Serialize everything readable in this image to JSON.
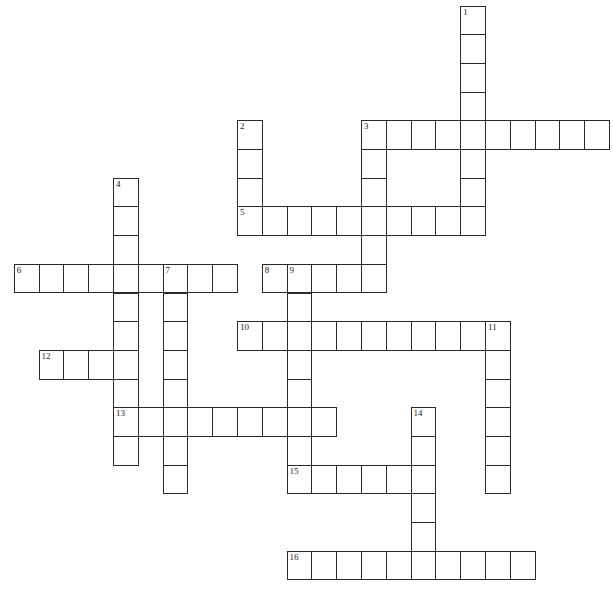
{
  "puzzle": {
    "type": "crossword",
    "layout": {
      "origin_x": 14.3,
      "origin_y": 6,
      "cell_w": 24.8,
      "cell_h": 28.7
    },
    "colors": {
      "border": "#2a2a2a",
      "cell_bg": "#ffffff",
      "number": "#222222"
    },
    "across": [
      {
        "number": "3",
        "row": 4,
        "col": 14,
        "length": 10
      },
      {
        "number": "5",
        "row": 7,
        "col": 9,
        "length": 10
      },
      {
        "number": "6",
        "row": 9,
        "col": 0,
        "length": 9
      },
      {
        "number": "8",
        "row": 9,
        "col": 10,
        "length": 5
      },
      {
        "number": "10",
        "row": 11,
        "col": 9,
        "length": 11
      },
      {
        "number": "12",
        "row": 12,
        "col": 1,
        "length": 4
      },
      {
        "number": "13",
        "row": 14,
        "col": 4,
        "length": 9
      },
      {
        "number": "15",
        "row": 16,
        "col": 11,
        "length": 6
      },
      {
        "number": "16",
        "row": 19,
        "col": 11,
        "length": 10
      }
    ],
    "down": [
      {
        "number": "1",
        "row": 0,
        "col": 18,
        "length": 8
      },
      {
        "number": "2",
        "row": 4,
        "col": 9,
        "length": 4
      },
      {
        "number": "3",
        "row": 4,
        "col": 14,
        "length": 6
      },
      {
        "number": "4",
        "row": 6,
        "col": 4,
        "length": 10
      },
      {
        "number": "7",
        "row": 9,
        "col": 6,
        "length": 8
      },
      {
        "number": "9",
        "row": 9,
        "col": 11,
        "length": 8
      },
      {
        "number": "11",
        "row": 11,
        "col": 19,
        "length": 6
      },
      {
        "number": "14",
        "row": 14,
        "col": 16,
        "length": 6
      }
    ]
  }
}
